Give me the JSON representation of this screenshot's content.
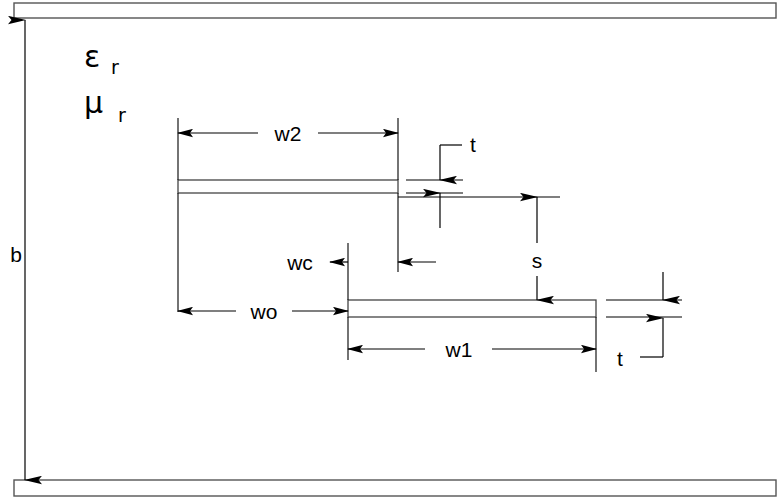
{
  "figure": {
    "type": "cross-section-schematic",
    "background_color": "#ffffff",
    "line_color": "#000000"
  },
  "labels": {
    "epsilon": "ε",
    "epsilon_sub": "r",
    "mu": "μ",
    "mu_sub": "r",
    "b": "b",
    "w2": "w2",
    "w1": "w1",
    "wc": "wc",
    "wo": "wo",
    "s": "s",
    "t_upper": "t",
    "t_lower": "t"
  },
  "geometry": {
    "top_plate": {
      "x": 14,
      "y": 3,
      "width": 762,
      "height": 15
    },
    "bottom_plate": {
      "x": 14,
      "y": 480,
      "width": 762,
      "height": 16
    },
    "upper_strip": {
      "x": 178,
      "y": 180,
      "width": 220,
      "height": 13
    },
    "lower_strip": {
      "x": 348,
      "y": 300,
      "width": 248,
      "height": 17
    }
  },
  "dimensions": [
    {
      "name": "b",
      "orientation": "vertical",
      "label": "b",
      "from_y": 20,
      "to_y": 480,
      "x": 25
    },
    {
      "name": "w2",
      "orientation": "horizontal",
      "label": "w2",
      "from_x": 178,
      "to_x": 398,
      "y": 133
    },
    {
      "name": "w1",
      "orientation": "horizontal",
      "label": "w1",
      "from_x": 348,
      "to_x": 596,
      "y": 349
    },
    {
      "name": "wc",
      "orientation": "horizontal",
      "label": "wc",
      "from_x": 348,
      "to_x": 398,
      "y": 262
    },
    {
      "name": "wo",
      "orientation": "horizontal",
      "label": "wo",
      "from_x": 178,
      "to_x": 348,
      "y": 311
    },
    {
      "name": "s",
      "orientation": "vertical",
      "label": "s",
      "from_y": 197,
      "to_y": 300,
      "x": 537
    },
    {
      "name": "t_upper",
      "orientation": "vertical-leader",
      "label": "t",
      "from_y": 145,
      "to_y": 180,
      "x": 440
    },
    {
      "name": "t_lower",
      "orientation": "vertical-leader",
      "label": "t",
      "from_y": 355,
      "to_y": 318,
      "x": 663
    }
  ]
}
